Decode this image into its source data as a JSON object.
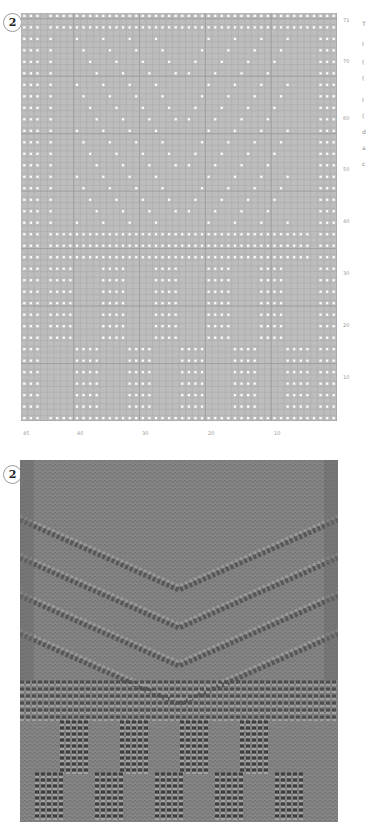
{
  "chart": {
    "badge": "2",
    "columns": 48,
    "rows": 71,
    "row_labels": [
      "71",
      "70",
      "60",
      "50",
      "40",
      "30",
      "20",
      "10"
    ],
    "col_labels": [
      "45",
      "40",
      "30",
      "20",
      "10"
    ],
    "colors": {
      "grid_bg": "#bdbdbd",
      "grid_line": "#a6a6a6",
      "dot": "#ffffff"
    },
    "legend": "white dot = purl stitch; blank = knit stitch"
  },
  "chart_data": {
    "type": "heatmap",
    "xlabel": "stitch (counted right to left)",
    "ylabel": "row",
    "x_ticks": [
      45,
      40,
      30,
      20,
      10
    ],
    "y_ticks": [
      71,
      70,
      60,
      50,
      40,
      30,
      20,
      10
    ],
    "grid": true,
    "sections": [
      {
        "rows": "34-71",
        "motif": "nested chevron (V) lines of purl dots with 3-stitch purl borders on each side"
      },
      {
        "rows": "28-33",
        "motif": "garter ridge band: alternating full purl rows"
      },
      {
        "rows": "1-27",
        "motif": "alternating blocks of 4-stitch purl columns, offset between upper and lower tiers"
      }
    ]
  },
  "photo": {
    "badge": "2",
    "caption": "Knitted swatch of chart 2"
  },
  "side_text": [
    "T",
    "I",
    "(",
    "(",
    "I",
    "(",
    "d",
    "a",
    "c"
  ]
}
